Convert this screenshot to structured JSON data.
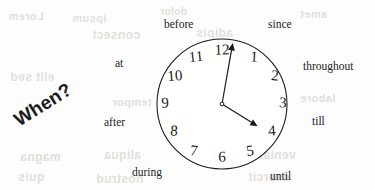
{
  "figure": {
    "headline": {
      "text": "When?",
      "rotation_deg": -32,
      "x": 22,
      "y": 128
    },
    "clock": {
      "center_x": 222,
      "center_y": 104,
      "radius": 65,
      "stroke_color": "#1a1a1a",
      "face_color": "#ffffff",
      "hands": {
        "minute": {
          "label": "minute-hand",
          "angle_deg": 10,
          "length": 62
        },
        "hour": {
          "label": "hour-hand",
          "angle_deg": 122,
          "length": 42
        }
      },
      "numerals": [
        {
          "value": "12",
          "x": 222,
          "y": 50,
          "tilt": -2
        },
        {
          "value": "1",
          "x": 254,
          "y": 57,
          "tilt": 4
        },
        {
          "value": "2",
          "x": 275,
          "y": 76,
          "tilt": 6
        },
        {
          "value": "3",
          "x": 283,
          "y": 103,
          "tilt": 2
        },
        {
          "value": "4",
          "x": 272,
          "y": 131,
          "tilt": -4
        },
        {
          "value": "5",
          "x": 250,
          "y": 151,
          "tilt": -8
        },
        {
          "value": "6",
          "x": 222,
          "y": 157,
          "tilt": -2
        },
        {
          "value": "7",
          "x": 194,
          "y": 151,
          "tilt": 6
        },
        {
          "value": "8",
          "x": 174,
          "y": 131,
          "tilt": 4
        },
        {
          "value": "9",
          "x": 165,
          "y": 103,
          "tilt": -2
        },
        {
          "value": "10",
          "x": 175,
          "y": 76,
          "tilt": -4
        },
        {
          "value": "11",
          "x": 196,
          "y": 57,
          "tilt": -6
        }
      ]
    },
    "prepositions": [
      {
        "id": "before",
        "text": "before",
        "x": 164,
        "y": 18
      },
      {
        "id": "since",
        "text": "since",
        "x": 268,
        "y": 18
      },
      {
        "id": "at",
        "text": "at",
        "x": 115,
        "y": 57
      },
      {
        "id": "throughout",
        "text": "throughout",
        "x": 303,
        "y": 60
      },
      {
        "id": "after",
        "text": "after",
        "x": 104,
        "y": 116
      },
      {
        "id": "till",
        "text": "till",
        "x": 312,
        "y": 115
      },
      {
        "id": "during",
        "text": "during",
        "x": 132,
        "y": 166
      },
      {
        "id": "until",
        "text": "until",
        "x": 270,
        "y": 170
      }
    ],
    "ghost_artifacts": [
      {
        "text": "Lorem",
        "x": 8,
        "y": 10,
        "size": 11,
        "rot": 0
      },
      {
        "text": "ipsum",
        "x": 72,
        "y": 12,
        "size": 11,
        "rot": 0
      },
      {
        "text": "dolor",
        "x": 160,
        "y": 6,
        "size": 10,
        "rot": 0
      },
      {
        "text": "amet",
        "x": 300,
        "y": 8,
        "size": 11,
        "rot": 0
      },
      {
        "text": "consect",
        "x": 92,
        "y": 28,
        "size": 12,
        "rot": 0
      },
      {
        "text": "adipis",
        "x": 196,
        "y": 26,
        "size": 12,
        "rot": 0
      },
      {
        "text": "elit sed",
        "x": 10,
        "y": 70,
        "size": 12,
        "rot": 0
      },
      {
        "text": "tempor",
        "x": 112,
        "y": 96,
        "size": 11,
        "rot": 0
      },
      {
        "text": "incidi",
        "x": 196,
        "y": 90,
        "size": 11,
        "rot": 0
      },
      {
        "text": "labore",
        "x": 300,
        "y": 92,
        "size": 11,
        "rot": 0
      },
      {
        "text": "magna",
        "x": 20,
        "y": 150,
        "size": 12,
        "rot": 0
      },
      {
        "text": "aliqua",
        "x": 104,
        "y": 148,
        "size": 12,
        "rot": 0
      },
      {
        "text": "veniam",
        "x": 252,
        "y": 148,
        "size": 12,
        "rot": 0
      },
      {
        "text": "quis",
        "x": 18,
        "y": 170,
        "size": 12,
        "rot": 0
      },
      {
        "text": "nostrud",
        "x": 96,
        "y": 172,
        "size": 12,
        "rot": 0
      },
      {
        "text": "exercit",
        "x": 248,
        "y": 170,
        "size": 12,
        "rot": 0
      }
    ]
  }
}
